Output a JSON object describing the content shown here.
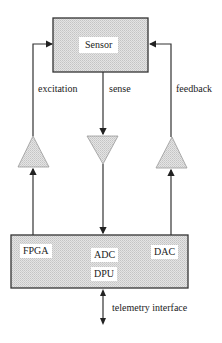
{
  "diagram": {
    "sensor_box": {
      "label": "Sensor"
    },
    "signals": {
      "excitation": "excitation",
      "sense": "sense",
      "feedback": "feedback"
    },
    "electronics_box": {
      "labels": {
        "fpga": "FPGA",
        "adc": "ADC",
        "dac": "DAC",
        "dpu": "DPU"
      }
    },
    "interface": {
      "label": "telemetry interface"
    },
    "colors": {
      "fill": "#d8d8d8",
      "stroke": "#333333",
      "label_bg": "#ffffff"
    }
  }
}
